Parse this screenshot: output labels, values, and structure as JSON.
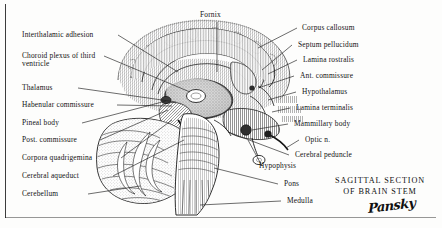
{
  "plate": {
    "title_lines": [
      "SAGITTAL SECTION",
      "OF BRAIN STEM"
    ],
    "signature": "Pansky",
    "ink_color": "#1a1a1a",
    "paper_color": "#fdfdfc"
  },
  "labels_top": [
    {
      "id": "fornix",
      "text": "Fornix"
    }
  ],
  "labels_left": [
    {
      "id": "interthalamic-adhesion",
      "text": "Interthalamic adhesion"
    },
    {
      "id": "choroid-plexus-third-ventricle",
      "text": "Choroid plexus of third ventricle"
    },
    {
      "id": "thalamus",
      "text": "Thalamus"
    },
    {
      "id": "habenular-commissure",
      "text": "Habenular commissure"
    },
    {
      "id": "pineal-body",
      "text": "Pineal body"
    },
    {
      "id": "post-commissure",
      "text": "Post. commissure"
    },
    {
      "id": "corpora-quadrigemina",
      "text": "Corpora quadrigemina"
    },
    {
      "id": "cerebral-aqueduct",
      "text": "Cerebral aqueduct"
    },
    {
      "id": "cerebellum",
      "text": "Cerebellum"
    }
  ],
  "labels_right": [
    {
      "id": "corpus-callosum",
      "text": "Corpus callosum"
    },
    {
      "id": "septum-pellucidum",
      "text": "Septum pellucidum"
    },
    {
      "id": "lamina-rostralis",
      "text": "Lamina rostralis"
    },
    {
      "id": "ant-commissure",
      "text": "Ant. commissure"
    },
    {
      "id": "hypothalamus",
      "text": "Hypothalamus"
    },
    {
      "id": "lamina-terminalis",
      "text": "Lamina terminalis"
    },
    {
      "id": "mammillary-body",
      "text": "Mammillary body"
    },
    {
      "id": "optic-n",
      "text": "Optic n."
    },
    {
      "id": "cerebral-peduncle",
      "text": "Cerebral peduncle"
    },
    {
      "id": "hypophysis",
      "text": "Hypophysis"
    },
    {
      "id": "pons",
      "text": "Pons"
    },
    {
      "id": "medulla",
      "text": "Medulla"
    }
  ]
}
